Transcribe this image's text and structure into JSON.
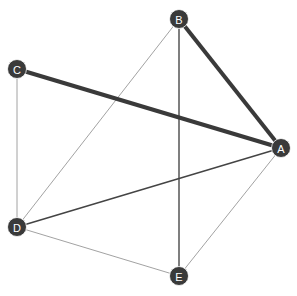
{
  "graph": {
    "background": "#ffffff",
    "node_color": "#3a3a3a",
    "label_color": "#ffffff",
    "nodes": [
      {
        "id": "A",
        "label": "A",
        "x": 281,
        "y": 148
      },
      {
        "id": "B",
        "label": "B",
        "x": 179,
        "y": 19
      },
      {
        "id": "C",
        "label": "C",
        "x": 17,
        "y": 69
      },
      {
        "id": "D",
        "label": "D",
        "x": 17,
        "y": 227
      },
      {
        "id": "E",
        "label": "E",
        "x": 179,
        "y": 276
      }
    ],
    "edges": [
      {
        "source": "C",
        "target": "D",
        "width": 0.8,
        "color": "#8a8a8a"
      },
      {
        "source": "B",
        "target": "D",
        "width": 0.8,
        "color": "#8a8a8a"
      },
      {
        "source": "D",
        "target": "E",
        "width": 0.8,
        "color": "#8a8a8a"
      },
      {
        "source": "A",
        "target": "E",
        "width": 0.8,
        "color": "#8a8a8a"
      },
      {
        "source": "B",
        "target": "E",
        "width": 1.5,
        "color": "#555555"
      },
      {
        "source": "D",
        "target": "A",
        "width": 1.5,
        "color": "#444444"
      },
      {
        "source": "C",
        "target": "A",
        "width": 4,
        "color": "#3a3a3a"
      },
      {
        "source": "B",
        "target": "A",
        "width": 4,
        "color": "#3a3a3a"
      }
    ]
  }
}
